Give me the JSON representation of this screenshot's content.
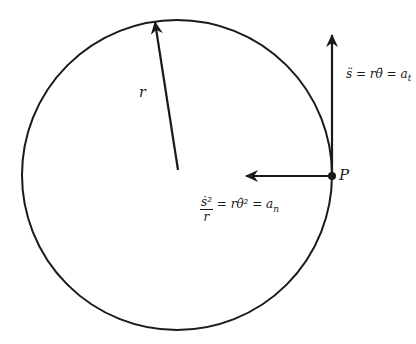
{
  "diagram": {
    "circle": {
      "cx": 177,
      "cy": 175,
      "r": 155,
      "stroke": "#1a1a1a"
    },
    "radius_vector": {
      "label": "r",
      "from": [
        178,
        170
      ],
      "to": [
        155,
        21
      ]
    },
    "point": {
      "label": "P",
      "x": 332,
      "y": 176
    },
    "tangential_arrow": {
      "from": [
        332,
        176
      ],
      "to": [
        332,
        34
      ],
      "label": "s̈ = rθ̈ = a",
      "label_subscript": "t"
    },
    "normal_arrow": {
      "from": [
        332,
        176
      ],
      "to": [
        245,
        176
      ],
      "label_numerator": "ṡ²",
      "label_denominator": "r",
      "label_rest": " = rθ̇² = a",
      "label_subscript": "n"
    }
  }
}
